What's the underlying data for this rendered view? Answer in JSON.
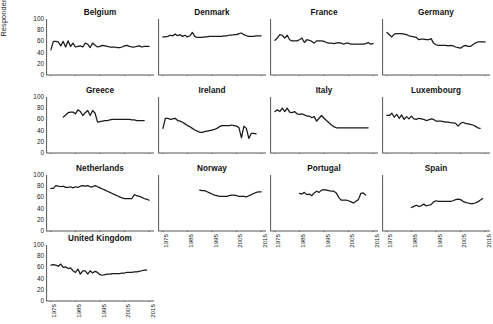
{
  "figure": {
    "ylabel": "Respondents with party attachment (%)",
    "y_ticks": [
      0,
      20,
      40,
      60,
      80,
      100
    ],
    "x_ticks": [
      1975,
      1985,
      1995,
      2005,
      2015
    ],
    "line_color": "#1a1a1a",
    "axis_color": "#555555"
  },
  "chart_data": {
    "type": "line",
    "title": "",
    "xlabel": "",
    "ylabel": "Respondents with party attachment (%)",
    "xlim": [
      1973,
      2017
    ],
    "ylim": [
      0,
      100
    ],
    "grid": false,
    "legend": "none",
    "tick_labels": {
      "x": [
        "1975",
        "1985",
        "1995",
        "2005",
        "2015"
      ],
      "y": [
        "0",
        "20",
        "40",
        "60",
        "80",
        "100"
      ]
    },
    "panel_layout": {
      "rows": 4,
      "cols": 4,
      "panels": 13
    },
    "panels": [
      {
        "name": "Belgium",
        "row": 1,
        "col": 1,
        "show_y_ticks": true,
        "show_x_ticks": false,
        "x": [
          1975,
          1976,
          1977,
          1978,
          1979,
          1980,
          1981,
          1982,
          1983,
          1984,
          1985,
          1986,
          1987,
          1988,
          1989,
          1990,
          1991,
          1992,
          1993,
          1994,
          1995,
          1996,
          1997,
          1998,
          1999,
          2000,
          2001,
          2002,
          2003,
          2004,
          2005,
          2006,
          2007,
          2008,
          2009,
          2010,
          2011,
          2012,
          2013,
          2014,
          2015
        ],
        "y": [
          45,
          60,
          60,
          59,
          52,
          60,
          50,
          61,
          51,
          57,
          50,
          51,
          52,
          50,
          57,
          55,
          49,
          57,
          53,
          50,
          51,
          53,
          52,
          51,
          50,
          50,
          50,
          49,
          49,
          50,
          52,
          53,
          51,
          50,
          50,
          51,
          52,
          50,
          51,
          51,
          51
        ]
      },
      {
        "name": "Denmark",
        "row": 1,
        "col": 2,
        "show_y_ticks": false,
        "show_x_ticks": false,
        "x": [
          1975,
          1976,
          1977,
          1978,
          1979,
          1980,
          1981,
          1982,
          1983,
          1984,
          1985,
          1986,
          1987,
          1988,
          1989,
          1990,
          1991,
          1992,
          1993,
          1994,
          1995,
          1996,
          1997,
          1998,
          1999,
          2000,
          2001,
          2002,
          2003,
          2004,
          2005,
          2006,
          2007,
          2008,
          2009,
          2010,
          2011,
          2012,
          2013,
          2014,
          2015
        ],
        "y": [
          68,
          68,
          69,
          71,
          70,
          73,
          70,
          72,
          69,
          71,
          68,
          70,
          76,
          69,
          67,
          67,
          67,
          68,
          68,
          69,
          69,
          69,
          69,
          69,
          69,
          70,
          70,
          71,
          71,
          72,
          72,
          74,
          75,
          72,
          70,
          69,
          69,
          69,
          70,
          70,
          70
        ]
      },
      {
        "name": "France",
        "row": 1,
        "col": 3,
        "show_y_ticks": false,
        "show_x_ticks": false,
        "x": [
          1975,
          1976,
          1977,
          1978,
          1979,
          1980,
          1981,
          1982,
          1983,
          1984,
          1985,
          1986,
          1987,
          1988,
          1989,
          1990,
          1991,
          1992,
          1993,
          1994,
          1995,
          1996,
          1997,
          1998,
          1999,
          2000,
          2001,
          2002,
          2003,
          2004,
          2005,
          2006,
          2007,
          2008,
          2009,
          2010,
          2011,
          2012,
          2013,
          2014,
          2015
        ],
        "y": [
          62,
          66,
          72,
          71,
          66,
          71,
          63,
          61,
          61,
          61,
          63,
          66,
          58,
          63,
          62,
          60,
          57,
          61,
          61,
          61,
          60,
          58,
          57,
          57,
          56,
          57,
          58,
          57,
          55,
          57,
          57,
          55,
          55,
          55,
          55,
          55,
          55,
          56,
          58,
          55,
          56
        ]
      },
      {
        "name": "Germany",
        "row": 1,
        "col": 4,
        "show_y_ticks": false,
        "show_x_ticks": false,
        "x": [
          1975,
          1976,
          1977,
          1978,
          1979,
          1980,
          1981,
          1982,
          1983,
          1984,
          1985,
          1986,
          1987,
          1988,
          1989,
          1990,
          1991,
          1992,
          1993,
          1994,
          1995,
          1996,
          1997,
          1998,
          1999,
          2000,
          2001,
          2002,
          2003,
          2004,
          2005,
          2006,
          2007,
          2008,
          2009,
          2010,
          2011,
          2012,
          2013,
          2014,
          2015
        ],
        "y": [
          76,
          72,
          68,
          73,
          74,
          74,
          74,
          73,
          72,
          70,
          69,
          68,
          67,
          63,
          64,
          64,
          63,
          63,
          65,
          57,
          54,
          53,
          53,
          53,
          53,
          52,
          53,
          52,
          50,
          49,
          48,
          51,
          53,
          51,
          51,
          54,
          57,
          59,
          59,
          59,
          59
        ]
      },
      {
        "name": "Greece",
        "row": 2,
        "col": 1,
        "show_y_ticks": true,
        "show_x_ticks": false,
        "x": [
          1980,
          1981,
          1982,
          1983,
          1984,
          1985,
          1986,
          1987,
          1988,
          1989,
          1990,
          1991,
          1992,
          1993,
          1994,
          1995,
          1996,
          1997,
          1998,
          1999,
          2000,
          2001,
          2002,
          2003,
          2004,
          2005,
          2006,
          2007,
          2008,
          2009,
          2010,
          2011,
          2012,
          2013
        ],
        "y": [
          64,
          68,
          72,
          73,
          73,
          70,
          77,
          74,
          67,
          72,
          76,
          67,
          76,
          71,
          55,
          56,
          57,
          58,
          58,
          59,
          60,
          60,
          60,
          60,
          60,
          60,
          60,
          60,
          59,
          59,
          58,
          58,
          58,
          58
        ]
      },
      {
        "name": "Ireland",
        "row": 2,
        "col": 2,
        "show_y_ticks": false,
        "show_x_ticks": false,
        "x": [
          1975,
          1976,
          1977,
          1978,
          1979,
          1980,
          1981,
          1982,
          1983,
          1984,
          1985,
          1986,
          1987,
          1988,
          1989,
          1990,
          1991,
          1992,
          1993,
          1994,
          1995,
          1996,
          1997,
          1998,
          1999,
          2000,
          2001,
          2002,
          2003,
          2004,
          2005,
          2006,
          2007,
          2008,
          2009,
          2010,
          2011,
          2012,
          2013
        ],
        "y": [
          44,
          62,
          62,
          60,
          61,
          62,
          58,
          57,
          55,
          52,
          49,
          47,
          44,
          41,
          39,
          37,
          37,
          38,
          39,
          40,
          41,
          42,
          44,
          47,
          49,
          49,
          49,
          49,
          50,
          49,
          48,
          45,
          27,
          48,
          44,
          26,
          35,
          35,
          34
        ]
      },
      {
        "name": "Italy",
        "row": 2,
        "col": 3,
        "show_y_ticks": false,
        "show_x_ticks": false,
        "x": [
          1975,
          1976,
          1977,
          1978,
          1979,
          1980,
          1981,
          1982,
          1983,
          1984,
          1985,
          1986,
          1987,
          1988,
          1989,
          1990,
          1991,
          1992,
          1993,
          1994,
          1995,
          1996,
          1997,
          1998,
          1999,
          2000,
          2001,
          2002,
          2003,
          2004,
          2005,
          2006,
          2007,
          2008,
          2009,
          2010,
          2011,
          2012,
          2013
        ],
        "y": [
          74,
          77,
          74,
          80,
          74,
          80,
          73,
          72,
          74,
          70,
          69,
          70,
          68,
          66,
          66,
          63,
          65,
          57,
          62,
          67,
          62,
          58,
          54,
          50,
          47,
          45,
          45,
          45,
          45,
          45,
          45,
          45,
          45,
          45,
          45,
          45,
          45,
          45,
          45
        ]
      },
      {
        "name": "Luxembourg",
        "row": 2,
        "col": 4,
        "show_y_ticks": false,
        "show_x_ticks": false,
        "x": [
          1975,
          1976,
          1977,
          1978,
          1979,
          1980,
          1981,
          1982,
          1983,
          1984,
          1985,
          1986,
          1987,
          1988,
          1989,
          1990,
          1991,
          1992,
          1993,
          1994,
          1995,
          1996,
          1997,
          1998,
          1999,
          2000,
          2001,
          2002,
          2003,
          2004,
          2005,
          2006,
          2007,
          2008,
          2009,
          2010,
          2011,
          2012,
          2013
        ],
        "y": [
          67,
          67,
          71,
          64,
          69,
          62,
          68,
          60,
          65,
          61,
          66,
          61,
          60,
          62,
          61,
          60,
          58,
          59,
          61,
          60,
          57,
          57,
          57,
          56,
          55,
          55,
          54,
          54,
          53,
          48,
          53,
          55,
          53,
          52,
          51,
          50,
          48,
          45,
          44
        ]
      },
      {
        "name": "Netherlands",
        "row": 3,
        "col": 1,
        "show_y_ticks": true,
        "show_x_ticks": false,
        "x": [
          1975,
          1976,
          1977,
          1978,
          1979,
          1980,
          1981,
          1982,
          1983,
          1984,
          1985,
          1986,
          1987,
          1988,
          1989,
          1990,
          1991,
          1992,
          1993,
          1994,
          1995,
          1996,
          1997,
          1998,
          1999,
          2000,
          2001,
          2002,
          2003,
          2004,
          2005,
          2006,
          2007,
          2008,
          2009,
          2010,
          2011,
          2012,
          2013,
          2014,
          2015
        ],
        "y": [
          76,
          76,
          81,
          80,
          79,
          80,
          78,
          78,
          79,
          77,
          79,
          78,
          80,
          81,
          80,
          81,
          79,
          79,
          81,
          79,
          77,
          75,
          73,
          71,
          69,
          67,
          65,
          63,
          61,
          59,
          58,
          58,
          58,
          58,
          65,
          63,
          62,
          60,
          58,
          57,
          55
        ]
      },
      {
        "name": "Norway",
        "row": 3,
        "col": 2,
        "show_y_ticks": false,
        "show_x_ticks": true,
        "x": [
          1990,
          1991,
          1992,
          1993,
          1994,
          1995,
          1996,
          1997,
          1998,
          1999,
          2000,
          2001,
          2002,
          2003,
          2004,
          2005,
          2006,
          2007,
          2008,
          2009,
          2010,
          2011,
          2012,
          2013,
          2014,
          2015
        ],
        "y": [
          73,
          72,
          72,
          70,
          68,
          66,
          64,
          63,
          62,
          62,
          62,
          62,
          63,
          64,
          64,
          63,
          62,
          62,
          62,
          61,
          63,
          65,
          67,
          69,
          70,
          70
        ]
      },
      {
        "name": "Portugal",
        "row": 3,
        "col": 3,
        "show_y_ticks": false,
        "show_x_ticks": true,
        "x": [
          1985,
          1986,
          1987,
          1988,
          1989,
          1990,
          1991,
          1992,
          1993,
          1994,
          1995,
          1996,
          1997,
          1998,
          1999,
          2000,
          2001,
          2002,
          2003,
          2004,
          2005,
          2006,
          2007,
          2008,
          2009,
          2010,
          2011,
          2012
        ],
        "y": [
          67,
          66,
          69,
          65,
          66,
          63,
          68,
          71,
          69,
          73,
          74,
          73,
          72,
          71,
          71,
          68,
          60,
          55,
          55,
          55,
          54,
          52,
          50,
          53,
          56,
          67,
          68,
          64
        ]
      },
      {
        "name": "Spain",
        "row": 3,
        "col": 4,
        "show_y_ticks": false,
        "show_x_ticks": true,
        "x": [
          1985,
          1986,
          1987,
          1988,
          1989,
          1990,
          1991,
          1992,
          1993,
          1994,
          1995,
          1996,
          1997,
          1998,
          1999,
          2000,
          2001,
          2002,
          2003,
          2004,
          2005,
          2006,
          2007,
          2008,
          2009,
          2010,
          2011,
          2012,
          2013,
          2014
        ],
        "y": [
          42,
          44,
          46,
          44,
          45,
          48,
          45,
          46,
          47,
          52,
          54,
          53,
          53,
          53,
          53,
          53,
          53,
          54,
          56,
          57,
          56,
          53,
          51,
          50,
          49,
          49,
          50,
          52,
          55,
          58
        ]
      },
      {
        "name": "United Kingdom",
        "row": 4,
        "col": 1,
        "show_y_ticks": true,
        "show_x_ticks": true,
        "x": [
          1975,
          1976,
          1977,
          1978,
          1979,
          1980,
          1981,
          1982,
          1983,
          1984,
          1985,
          1986,
          1987,
          1988,
          1989,
          1990,
          1991,
          1992,
          1993,
          1994,
          1995,
          1996,
          1997,
          1998,
          1999,
          2000,
          2001,
          2002,
          2003,
          2004,
          2005,
          2006,
          2007,
          2008,
          2009,
          2010,
          2011,
          2012,
          2013,
          2014,
          2015
        ],
        "y": [
          64,
          65,
          64,
          62,
          66,
          60,
          61,
          58,
          59,
          54,
          51,
          57,
          48,
          54,
          54,
          48,
          54,
          50,
          53,
          51,
          47,
          46,
          47,
          48,
          48,
          49,
          49,
          49,
          49,
          50,
          50,
          51,
          51,
          51,
          52,
          52,
          53,
          54,
          55,
          55
        ]
      }
    ]
  }
}
